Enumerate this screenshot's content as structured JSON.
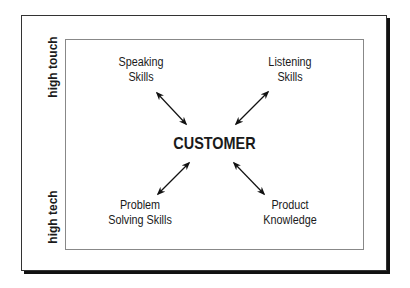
{
  "diagram": {
    "center_label": "CUSTOMER",
    "side_labels": {
      "top": "high touch",
      "bottom": "high tech"
    },
    "nodes": [
      {
        "id": "speaking",
        "line1": "Speaking",
        "line2": "Skills",
        "position": "top-left"
      },
      {
        "id": "listening",
        "line1": "Listening",
        "line2": "Skills",
        "position": "top-right"
      },
      {
        "id": "problem",
        "line1": "Problem",
        "line2": "Solving Skills",
        "position": "bottom-left"
      },
      {
        "id": "product",
        "line1": "Product",
        "line2": "Knowledge",
        "position": "bottom-right"
      }
    ],
    "edges": [
      {
        "from": "speaking",
        "to": "CUSTOMER",
        "type": "bidirectional"
      },
      {
        "from": "listening",
        "to": "CUSTOMER",
        "type": "bidirectional"
      },
      {
        "from": "problem",
        "to": "CUSTOMER",
        "type": "bidirectional"
      },
      {
        "from": "product",
        "to": "CUSTOMER",
        "type": "bidirectional"
      }
    ]
  }
}
